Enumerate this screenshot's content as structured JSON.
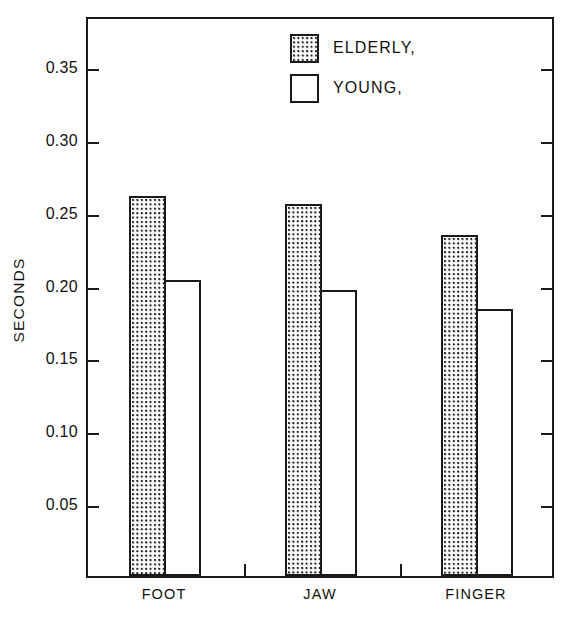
{
  "chart_data": {
    "type": "bar",
    "title": "",
    "xlabel": "",
    "ylabel": "SECONDS",
    "categories": [
      "FOOT",
      "JAW",
      "FINGER"
    ],
    "series": [
      {
        "name": "ELDERLY,",
        "fill": "dotted",
        "values": [
          0.261,
          0.255,
          0.234
        ]
      },
      {
        "name": "YOUNG,",
        "fill": "open",
        "values": [
          0.203,
          0.196,
          0.183
        ]
      }
    ],
    "ylim": [
      0,
      0.385
    ],
    "yticks": [
      0.05,
      0.1,
      0.15,
      0.2,
      0.25,
      0.3,
      0.35
    ],
    "ytick_labels": [
      "0.05",
      "0.10",
      "0.15",
      "0.20",
      "0.25",
      "0.30",
      "0.35"
    ],
    "grid": false,
    "legend_position": "top-center",
    "frame": "box",
    "colors": {
      "line": "#1a1a1a",
      "background": "#ffffff"
    }
  },
  "legend": {
    "entries": [
      {
        "label": "ELDERLY,",
        "swatch": "dotted-square-swatch"
      },
      {
        "label": "YOUNG,",
        "swatch": "open-square-swatch"
      }
    ]
  }
}
